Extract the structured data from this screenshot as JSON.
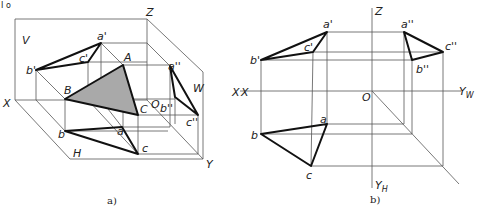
{
  "figure_marker": "I o",
  "panel_a": {
    "caption": "a)",
    "plane_labels": {
      "V": "V",
      "H": "H",
      "W": "W"
    },
    "axis_labels": {
      "X": "X",
      "Y": "Y",
      "Z": "Z",
      "O": "O"
    },
    "space_points": {
      "A": "A",
      "B": "B",
      "C": "C"
    },
    "v_projections": {
      "a": "a'",
      "b": "b'",
      "c": "c'"
    },
    "h_projections": {
      "a": "a",
      "b": "b",
      "c": "c"
    },
    "w_projections": {
      "a": "a''",
      "b": "b''",
      "c": "c''"
    },
    "edge_label_right": "X"
  },
  "panel_b": {
    "caption": "b)",
    "axis_labels": {
      "Z": "Z",
      "X": "X",
      "O": "O",
      "YW": "Y",
      "YW_sub": "W",
      "YH": "Y",
      "YH_sub": "H"
    },
    "v_projections": {
      "a": "a'",
      "b": "b'",
      "c": "c'"
    },
    "h_projections": {
      "a": "a",
      "b": "b",
      "c": "c"
    },
    "w_projections": {
      "a": "a''",
      "b": "b''",
      "c": "c''"
    }
  },
  "colors": {
    "shade": "#a9a9a9",
    "line": "#111111",
    "thin": "#555555"
  }
}
